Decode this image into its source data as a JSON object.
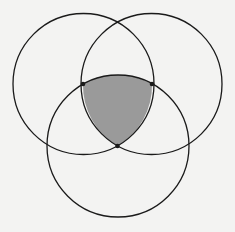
{
  "diagram": {
    "type": "three-circle venn / reuleaux triangle construction",
    "background": "#f3f3f2",
    "stroke_color": "#1a1a1a",
    "fill_color": "#9a9a9a",
    "circles": [
      {
        "name": "left",
        "cx": 83.5,
        "cy": 84,
        "r": 70.5
      },
      {
        "name": "right",
        "cx": 151.5,
        "cy": 84,
        "r": 70.5
      },
      {
        "name": "bottom",
        "cx": 118,
        "cy": 146,
        "r": 71
      }
    ],
    "points": [
      {
        "name": "left-point",
        "x": 83,
        "y": 84
      },
      {
        "name": "right-point",
        "x": 152,
        "y": 84
      },
      {
        "name": "bottom-point",
        "x": 117.5,
        "y": 146
      }
    ],
    "shaded_region": "intersection of all three circles (Reuleaux triangle)"
  }
}
